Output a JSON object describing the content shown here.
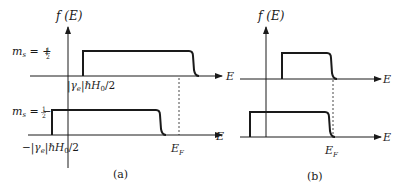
{
  "figure_a": {
    "caption": "(a)",
    "y_axis_label": "f (E)",
    "x_axis_label": "E",
    "upper_panel": {
      "spin_label_prefix": "m",
      "spin_label_sub": "s",
      "spin_label_value": " = +",
      "spin_fraction": "1/2",
      "step_start_label": "|γ",
      "step_start_label_sub": "e",
      "step_start_label_rest": "|ℏH",
      "step_start_label_sub2": "0",
      "step_start_label_end": "/2"
    },
    "lower_panel": {
      "spin_label_prefix": "m",
      "spin_label_sub": "s",
      "spin_label_value": " = −",
      "spin_fraction": "1/2",
      "step_start_label": "−|γ",
      "step_start_label_sub": "e",
      "step_start_label_rest": "|ℏH",
      "step_start_label_sub2": "0",
      "step_start_label_end": "/2",
      "fermi_label": "E",
      "fermi_label_sub": "F"
    }
  },
  "figure_b": {
    "caption": "(b)",
    "y_axis_label": "f (E)",
    "x_axis_label": "E",
    "fermi_label": "E",
    "fermi_label_sub": "F"
  },
  "colors": {
    "line": "#1a1a1a",
    "background": "#ffffff"
  }
}
